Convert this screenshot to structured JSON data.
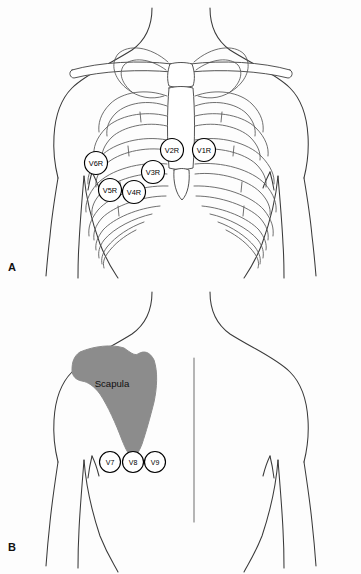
{
  "figure": {
    "background_color": "#fdfdfd",
    "line_color": "#3a3a3a",
    "bone_color": "#ffffff",
    "scapula_color": "#8c8c8c",
    "lead_circle_fill": "#ffffff",
    "lead_circle_stroke": "#000000"
  },
  "panels": [
    {
      "letter": "A",
      "name": "anterior-chest-view",
      "description": "Anterior torso with ribcage, clavicles and sternum showing right-sided precordial leads",
      "leads": [
        {
          "label": "V1R",
          "cx": 204,
          "cy": 150,
          "r": 11.5
        },
        {
          "label": "V2R",
          "cx": 172,
          "cy": 150,
          "r": 11.5
        },
        {
          "label": "V3R",
          "cx": 153,
          "cy": 172,
          "r": 11.5
        },
        {
          "label": "V4R",
          "cx": 134,
          "cy": 192,
          "r": 11.5
        },
        {
          "label": "V5R",
          "cx": 110,
          "cy": 190,
          "r": 11.5
        },
        {
          "label": "V6R",
          "cx": 96,
          "cy": 163,
          "r": 11.5
        }
      ]
    },
    {
      "letter": "B",
      "name": "posterior-chest-view",
      "description": "Posterior torso with left scapula showing posterior leads",
      "anatomy_label": "Scapula",
      "anatomy_label_x": 112,
      "anatomy_label_y": 383,
      "leads": [
        {
          "label": "V7",
          "cx": 110,
          "cy": 462,
          "r": 10.5
        },
        {
          "label": "V8",
          "cx": 133,
          "cy": 462,
          "r": 10.5
        },
        {
          "label": "V9",
          "cx": 155,
          "cy": 462,
          "r": 10.5
        }
      ]
    }
  ]
}
